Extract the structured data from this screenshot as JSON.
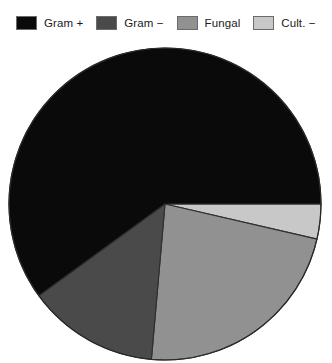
{
  "legend": {
    "items": [
      {
        "label": "Gram +",
        "color": "#0a0a0a",
        "swatch_name": "legend-swatch-gram-positive"
      },
      {
        "label": "Gram −",
        "color": "#4a4a4a",
        "swatch_name": "legend-swatch-gram-negative"
      },
      {
        "label": "Fungal",
        "color": "#919191",
        "swatch_name": "legend-swatch-fungal"
      },
      {
        "label": "Cult. −",
        "color": "#c8c8c8",
        "swatch_name": "legend-swatch-culture-negative"
      }
    ]
  },
  "chart_data": {
    "type": "pie",
    "title": "",
    "subtitle": "",
    "xlabel": "",
    "ylabel": "",
    "grid": false,
    "legend_position": "top",
    "start_angle_deg": 90,
    "direction": "clockwise",
    "center": {
      "x": 165,
      "y": 204
    },
    "radius": 156,
    "labels": [
      "Cult. −",
      "Fungal",
      "Gram −",
      "Gram +"
    ],
    "colors": [
      "#c8c8c8",
      "#919191",
      "#4a4a4a",
      "#0a0a0a"
    ],
    "values": [
      3.6,
      22.8,
      13.6,
      60.0
    ],
    "value_unit": "percent",
    "angles_deg": [
      13,
      82,
      49,
      216
    ],
    "slices": [
      {
        "label": "Cult. −",
        "value": 3.6,
        "angle_deg": 13,
        "color": "#c8c8c8",
        "start_deg": 90,
        "end_deg": 103
      },
      {
        "label": "Fungal",
        "value": 22.8,
        "angle_deg": 82,
        "color": "#919191",
        "start_deg": 103,
        "end_deg": 185
      },
      {
        "label": "Gram −",
        "value": 13.6,
        "angle_deg": 49,
        "color": "#4a4a4a",
        "start_deg": 185,
        "end_deg": 234
      },
      {
        "label": "Gram +",
        "value": 60.0,
        "angle_deg": 216,
        "color": "#0a0a0a",
        "start_deg": 234,
        "end_deg": 450
      }
    ]
  }
}
